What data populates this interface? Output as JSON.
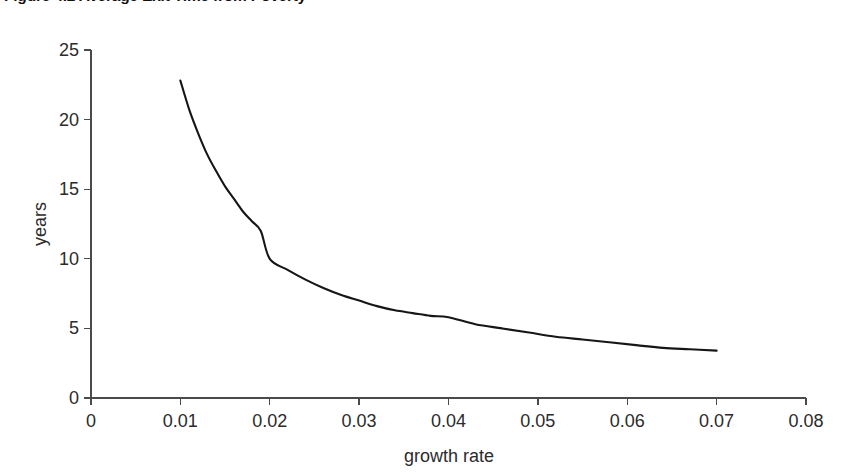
{
  "figure": {
    "title": "Figure 4.2 Average Exit Time from Poverty"
  },
  "axis_labels": {
    "x": "growth rate",
    "y": "years"
  },
  "colors": {
    "background": "#ffffff",
    "line": "#161616",
    "axis": "#4a4a4a",
    "text": "#2b2b2b",
    "title": "#111111"
  },
  "chart_data": {
    "type": "line",
    "title": "Figure 4.2 Average Exit Time from Poverty",
    "xlabel": "growth rate",
    "ylabel": "years",
    "xlim": [
      0,
      0.08
    ],
    "ylim": [
      0,
      25
    ],
    "grid": false,
    "legend": null,
    "xticks": [
      0,
      0.01,
      0.02,
      0.03,
      0.04,
      0.05,
      0.06,
      0.07,
      0.08
    ],
    "xticklabels": [
      "0",
      "0.01",
      "0.02",
      "0.03",
      "0.04",
      "0.05",
      "0.06",
      "0.07",
      "0.08"
    ],
    "yticks": [
      0,
      5,
      10,
      15,
      20,
      25
    ],
    "yticklabels": [
      "0",
      "5",
      "10",
      "15",
      "20",
      "25"
    ],
    "series": [
      {
        "name": "average exit time",
        "x": [
          0.01,
          0.011,
          0.012,
          0.013,
          0.014,
          0.015,
          0.016,
          0.017,
          0.018,
          0.019,
          0.02,
          0.022,
          0.024,
          0.026,
          0.028,
          0.03,
          0.032,
          0.034,
          0.036,
          0.038,
          0.04,
          0.043,
          0.046,
          0.049,
          0.052,
          0.055,
          0.058,
          0.061,
          0.064,
          0.067,
          0.07
        ],
        "y": [
          22.8,
          20.7,
          19.0,
          17.5,
          16.3,
          15.2,
          14.3,
          13.4,
          12.7,
          12.0,
          10.0,
          9.2,
          8.5,
          7.9,
          7.4,
          7.0,
          6.6,
          6.3,
          6.1,
          5.9,
          5.8,
          5.3,
          5.0,
          4.7,
          4.4,
          4.2,
          4.0,
          3.8,
          3.6,
          3.5,
          3.4
        ]
      }
    ]
  }
}
